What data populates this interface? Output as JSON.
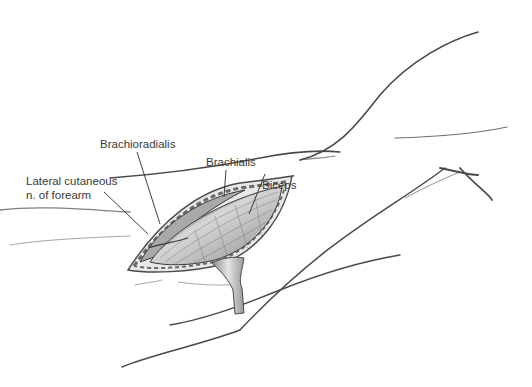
{
  "figure": {
    "type": "surgical anatomy illustration",
    "labels": {
      "brachialis": "Brachialis",
      "biceps": "Biceps",
      "brachioradialis": "Brachioradialis",
      "lateral_cutaneous_line1": "Lateral cutaneous",
      "lateral_cutaneous_line2": "n. of forearm"
    },
    "colors": {
      "outline": "#4a4a4a",
      "muscle_fill": "#c8c8c8",
      "muscle_dark": "#6e6e6e",
      "retractor": "#b5b5b5",
      "background": "#ffffff"
    }
  }
}
